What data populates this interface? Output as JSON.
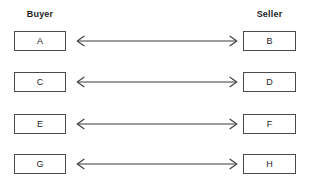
{
  "diagram": {
    "background_color": "#ffffff",
    "line_color": "#3d3d3d",
    "box_border_color": "#4a4a4a",
    "text_color": "#1d1d1f",
    "columns": {
      "left_header": "Buyer",
      "right_header": "Seller"
    },
    "rows": [
      {
        "left_label": "A",
        "right_label": "B",
        "connector": "double-headed-arrow",
        "y": 31
      },
      {
        "left_label": "C",
        "right_label": "D",
        "connector": "double-headed-arrow",
        "y": 72
      },
      {
        "left_label": "E",
        "right_label": "F",
        "connector": "double-headed-arrow",
        "y": 114
      },
      {
        "left_label": "G",
        "right_label": "H",
        "connector": "double-headed-arrow",
        "y": 154
      }
    ]
  }
}
